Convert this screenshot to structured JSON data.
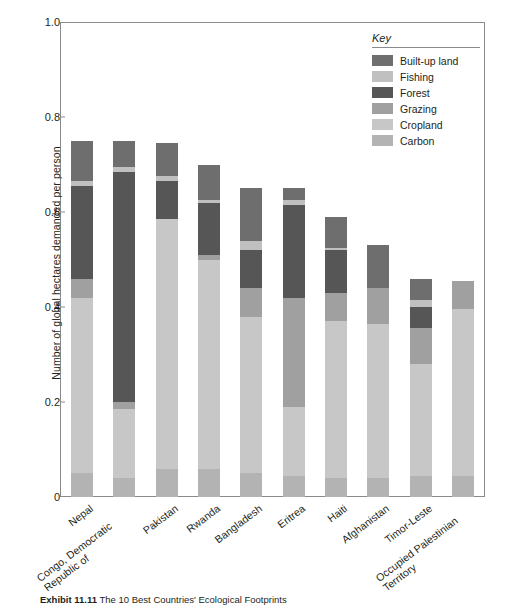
{
  "chart_data": {
    "type": "bar",
    "stacked": true,
    "title": "",
    "xlabel": "",
    "ylabel": "Number of global hectares demanded per person",
    "ylim": [
      0,
      1.0
    ],
    "yticks": [
      "0",
      "0.2",
      "0.4",
      "0.6",
      "0.8",
      "1.0"
    ],
    "ytick_values": [
      0,
      0.2,
      0.4,
      0.6,
      0.8,
      1.0
    ],
    "grid": false,
    "legend_position": "top-right",
    "legend_title": "Key",
    "categories": [
      "Nepal",
      "Congo, Democratic Republic of",
      "Pakistan",
      "Rwanda",
      "Bangladesh",
      "Eritrea",
      "Haiti",
      "Afghanistan",
      "Timor-Leste",
      "Occupied Palestinian Territory"
    ],
    "series": [
      {
        "name": "Carbon",
        "color": "#b3b3b3",
        "values": [
          0.05,
          0.04,
          0.06,
          0.06,
          0.05,
          0.045,
          0.04,
          0.04,
          0.045,
          0.045
        ]
      },
      {
        "name": "Cropland",
        "color": "#c7c7c7",
        "values": [
          0.37,
          0.145,
          0.525,
          0.44,
          0.33,
          0.145,
          0.33,
          0.325,
          0.235,
          0.35
        ]
      },
      {
        "name": "Grazing",
        "color": "#a0a0a0",
        "values": [
          0.04,
          0.015,
          0.0,
          0.01,
          0.06,
          0.23,
          0.06,
          0.075,
          0.075,
          0.06
        ]
      },
      {
        "name": "Forest",
        "color": "#565656",
        "values": [
          0.195,
          0.485,
          0.08,
          0.11,
          0.08,
          0.195,
          0.09,
          0.0,
          0.045,
          0.0
        ]
      },
      {
        "name": "Fishing",
        "color": "#c0c0c0",
        "values": [
          0.01,
          0.01,
          0.01,
          0.005,
          0.02,
          0.01,
          0.005,
          0.0,
          0.015,
          0.0
        ]
      },
      {
        "name": "Built-up land",
        "color": "#6e6e6e",
        "values": [
          0.085,
          0.055,
          0.07,
          0.075,
          0.11,
          0.025,
          0.065,
          0.09,
          0.045,
          0.0
        ]
      }
    ],
    "totals": [
      0.75,
      0.75,
      0.745,
      0.7,
      0.65,
      0.65,
      0.59,
      0.53,
      0.46,
      0.455
    ]
  },
  "legend": {
    "title": "Key",
    "items": [
      {
        "label": "Built-up land",
        "color": "#6e6e6e"
      },
      {
        "label": "Fishing",
        "color": "#c0c0c0"
      },
      {
        "label": "Forest",
        "color": "#565656"
      },
      {
        "label": "Grazing",
        "color": "#a0a0a0"
      },
      {
        "label": "Cropland",
        "color": "#c7c7c7"
      },
      {
        "label": "Carbon",
        "color": "#b3b3b3"
      }
    ]
  },
  "caption": {
    "number": "Exhibit 11.11",
    "text": "The 10 Best Countries' Ecological Footprints"
  }
}
